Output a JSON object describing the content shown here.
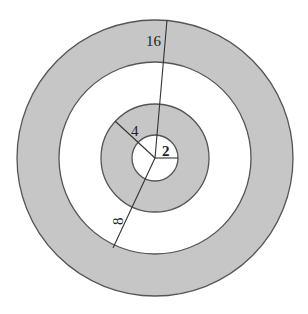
{
  "diagram": {
    "type": "concentric-circles",
    "center": [
      155,
      158
    ],
    "colors": {
      "shaded_fill": "#c6c6c6",
      "unshaded_fill": "#ffffff",
      "stroke": "#555555",
      "text": "#222222"
    },
    "circles": [
      {
        "radius_label": "16",
        "pixel_radius": 138,
        "fill": "shaded"
      },
      {
        "radius_label": "8",
        "pixel_radius": 96,
        "fill": "unshaded"
      },
      {
        "radius_label": "4",
        "pixel_radius": 54,
        "fill": "shaded"
      },
      {
        "radius_label": "2",
        "pixel_radius": 23,
        "fill": "unshaded"
      }
    ],
    "radius_lines": [
      {
        "label": "16",
        "end": [
          167,
          20
        ]
      },
      {
        "label": "8",
        "end": [
          113,
          248
        ]
      },
      {
        "label": "4",
        "end": [
          115,
          121
        ]
      },
      {
        "label": "2",
        "end": [
          178,
          158
        ]
      }
    ],
    "labels": {
      "r16": "16",
      "r8": "8",
      "r4": "4",
      "r2": "2"
    }
  }
}
